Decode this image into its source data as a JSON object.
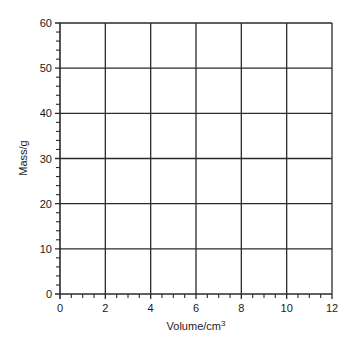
{
  "chart_data": {
    "type": "scatter",
    "title": "",
    "xlabel": "Volume/cm",
    "xlabel_superscript": "3",
    "ylabel": "Mass/g",
    "xlim": [
      0,
      12
    ],
    "ylim": [
      0,
      60
    ],
    "x_major_ticks": [
      0,
      2,
      4,
      6,
      8,
      10,
      12
    ],
    "y_major_ticks": [
      0,
      10,
      20,
      30,
      40,
      50,
      60
    ],
    "x_minor_step": 0.5,
    "y_minor_step": 2,
    "grid": true,
    "series": [],
    "note": "Blank graph grid with no plotted data"
  },
  "colors": {
    "grid": "#2a2a2a",
    "text": "#1a1a1a",
    "background": "#ffffff"
  }
}
